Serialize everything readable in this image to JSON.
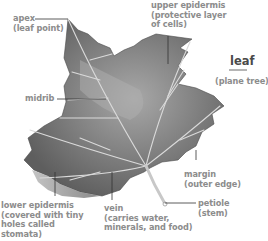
{
  "diagram": {
    "title": "leaf",
    "subtitle": "(plane tree)",
    "colors": {
      "label_text": "#8c8c8c",
      "title_text": "#4a4a4a",
      "leader_line": "#333333",
      "leaf_dark": "#5a5a5a",
      "leaf_light": "#b8b8b8",
      "vein": "#d8d8d8"
    },
    "labels": {
      "apex": {
        "line1": "apex",
        "line2": "(leaf point)"
      },
      "upper_epidermis": {
        "line1": "upper epidermis",
        "line2": "(protective layer",
        "line3": "of cells)"
      },
      "midrib": {
        "line1": "midrib"
      },
      "margin": {
        "line1": "margin",
        "line2": "(outer edge)"
      },
      "petiole": {
        "line1": "petiole",
        "line2": "(stem)"
      },
      "lower_epidermis": {
        "line1": "lower epidermis",
        "line2": "(covered with tiny",
        "line3": "holes called",
        "line4": "stomata)"
      },
      "vein": {
        "line1": "vein",
        "line2": "(carries water,",
        "line3": "minerals, and food)"
      }
    }
  }
}
